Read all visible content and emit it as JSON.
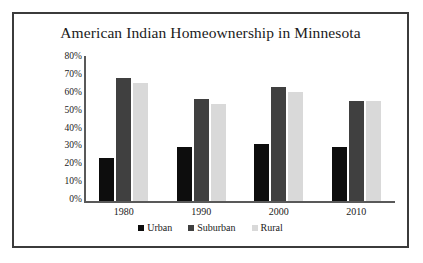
{
  "chart_data": {
    "type": "bar",
    "title": "American Indian Homeownership in Minnesota",
    "xlabel": "",
    "ylabel": "",
    "categories": [
      "1980",
      "1990",
      "2000",
      "2010"
    ],
    "series": [
      {
        "name": "Urban",
        "color": "#0D0D0D",
        "values": [
          24,
          30,
          32,
          30
        ]
      },
      {
        "name": "Suburban",
        "color": "#404040",
        "values": [
          69,
          57,
          64,
          56
        ]
      },
      {
        "name": "Rural",
        "color": "#D9D9D9",
        "values": [
          66,
          54,
          61,
          56
        ]
      }
    ],
    "ylim": [
      0,
      80
    ],
    "ytick_values": [
      80,
      70,
      60,
      50,
      40,
      30,
      20,
      10,
      0
    ],
    "ytick_labels": [
      "80%",
      "70%",
      "60%",
      "50%",
      "40%",
      "30%",
      "20%",
      "10%",
      "0%"
    ],
    "grid": false,
    "legend_position": "bottom",
    "value_format": "percent"
  },
  "frame": {
    "border_color": "#3B3B3B",
    "background": "#FFFFFF",
    "axis_color": "#595959"
  }
}
